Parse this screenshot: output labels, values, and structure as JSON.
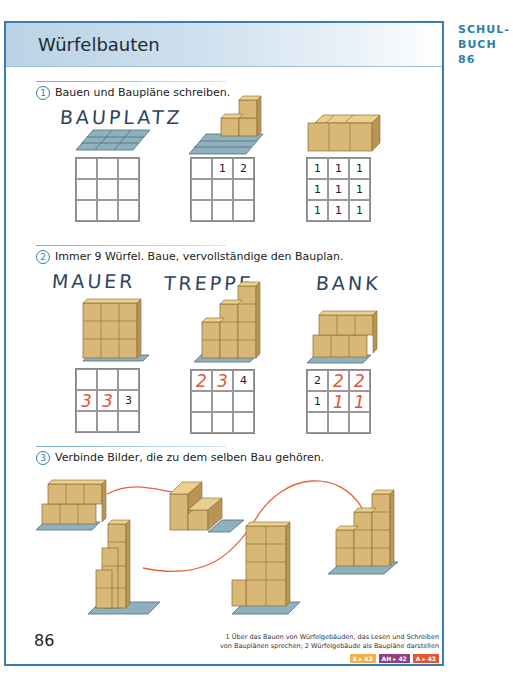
{
  "header": {
    "title": "Würfelbauten",
    "book_ref_line1": "SCHUL-",
    "book_ref_line2": "BUCH 86"
  },
  "tasks": [
    {
      "number": "1",
      "instruction": "Bauen und Baupläne schreiben.",
      "label": "BAUPLATZ",
      "plans": [
        {
          "cells": [
            "",
            "",
            "",
            "",
            "",
            "",
            "",
            "",
            ""
          ],
          "red": []
        },
        {
          "cells": [
            "",
            "1",
            "2",
            "",
            "",
            "",
            "",
            "",
            ""
          ],
          "red": []
        },
        {
          "cells": [
            "1",
            "1",
            "1",
            "1",
            "1",
            "1",
            "1",
            "1",
            "1"
          ],
          "red": []
        }
      ]
    },
    {
      "number": "2",
      "instruction": "Immer 9 Würfel. Baue, vervollständige den Bauplan.",
      "labels": [
        "MAUER",
        "TREPPE",
        "BANK"
      ],
      "plans": [
        {
          "cells": [
            "",
            "",
            "",
            "3",
            "3",
            "3",
            "",
            "",
            ""
          ],
          "red": [
            3,
            4
          ]
        },
        {
          "cells": [
            "2",
            "3",
            "4",
            "",
            "",
            "",
            "",
            "",
            ""
          ],
          "red": [
            0,
            1
          ]
        },
        {
          "cells": [
            "2",
            "2",
            "2",
            "1",
            "1",
            "1",
            "",
            "",
            ""
          ],
          "red": [
            1,
            2,
            4,
            5
          ]
        }
      ]
    },
    {
      "number": "3",
      "instruction": "Verbinde Bilder, die zu dem selben Bau gehören."
    }
  ],
  "footer": {
    "page_number": "86",
    "note_line1": "1 Über das Bauen von Würfelgebäuden, das Lesen und Schreiben",
    "note_line2": "von Bauplänen sprechen;  2 Würfelgebäude als Baupläne darstellen",
    "badges": [
      {
        "label": "E ▸ 43",
        "color": "#f5b04a"
      },
      {
        "label": "AH ▸ 42",
        "color": "#8e3f86"
      },
      {
        "label": "A ▸ 43",
        "color": "#e4572e"
      }
    ]
  },
  "colors": {
    "accent_blue": "#3a7db5",
    "handwriting_red": "#e0553a",
    "wood": "#d9b877",
    "baseplate": "#8fb0bd",
    "connector_line": "#e8623d"
  }
}
